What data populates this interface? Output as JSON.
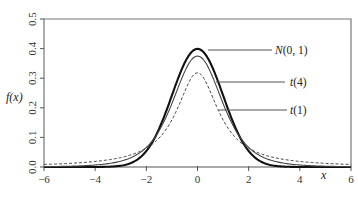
{
  "chart_data": {
    "type": "line",
    "title": "",
    "xlabel": "x",
    "ylabel": "f(x)",
    "xlim": [
      -6,
      6
    ],
    "ylim": [
      0,
      0.5
    ],
    "grid": false,
    "legend_position": "inline-annotations-right-of-peak",
    "x_ticks": [
      -6,
      -4,
      -2,
      0,
      2,
      4,
      6
    ],
    "x_tick_labels": [
      "−6",
      "−4",
      "−2",
      "0",
      "2",
      "4",
      "6"
    ],
    "y_ticks": [
      0.0,
      0.1,
      0.2,
      0.3,
      0.4,
      0.5
    ],
    "y_tick_labels": [
      "0.0",
      "0.1",
      "0.2",
      "0.3",
      "0.4",
      "0.5"
    ],
    "x": [
      -6,
      -5,
      -4,
      -3,
      -2,
      -1,
      0,
      1,
      2,
      3,
      4,
      5,
      6
    ],
    "series": [
      {
        "name": "N(0, 1)",
        "label_prefix": "N",
        "label_args": "(0, 1)",
        "style": "solid-thick",
        "values": [
          0.0,
          0.0,
          0.0001,
          0.0044,
          0.054,
          0.242,
          0.3989,
          0.242,
          0.054,
          0.0044,
          0.0001,
          0.0,
          0.0
        ]
      },
      {
        "name": "t(4)",
        "label_prefix": "t",
        "label_args": "(4)",
        "style": "solid-thin",
        "values": [
          0.0011,
          0.0026,
          0.0067,
          0.0197,
          0.0663,
          0.2197,
          0.375,
          0.2197,
          0.0663,
          0.0197,
          0.0067,
          0.0026,
          0.0011
        ]
      },
      {
        "name": "t(1)",
        "label_prefix": "t",
        "label_args": "(1)",
        "style": "dashed",
        "values": [
          0.0086,
          0.0122,
          0.0187,
          0.0318,
          0.0637,
          0.1592,
          0.3183,
          0.1592,
          0.0637,
          0.0318,
          0.0187,
          0.0122,
          0.0086
        ]
      }
    ]
  },
  "colors": {
    "axis": "#555555",
    "frame": "#777777",
    "normal": "#111111",
    "t4": "#444444",
    "t1": "#444444",
    "leader": "#555555"
  }
}
